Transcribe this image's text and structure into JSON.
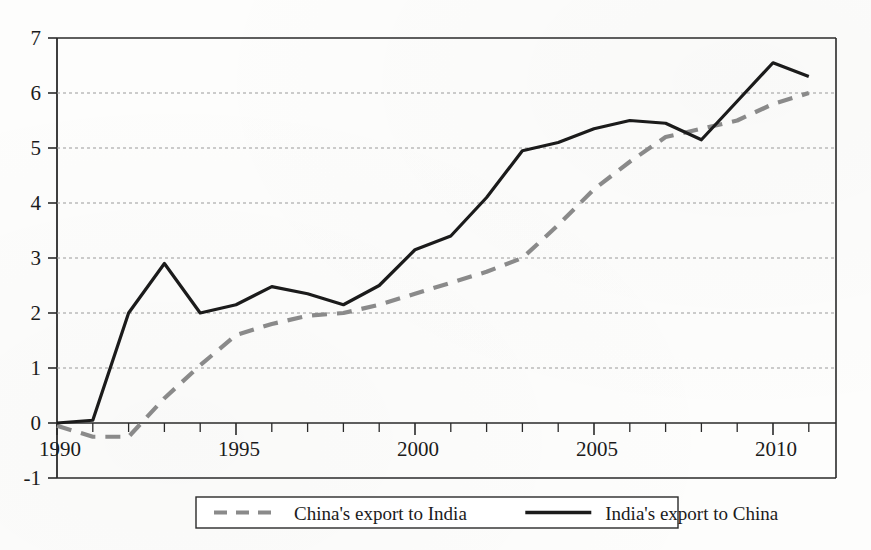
{
  "chart_data": {
    "type": "line",
    "title": "",
    "subtitle": "",
    "xlabel": "",
    "ylabel": "",
    "xlim": [
      1990,
      2011
    ],
    "ylim": [
      -1,
      7
    ],
    "grid": true,
    "grid_axis": "y",
    "legend_position": "bottom",
    "y_ticks": [
      "7",
      "6",
      "5",
      "4",
      "3",
      "2",
      "1",
      "0",
      "-1"
    ],
    "y_tick_values": [
      7,
      6,
      5,
      4,
      3,
      2,
      1,
      0,
      -1
    ],
    "x_ticks": [
      "1990",
      "1995",
      "2000",
      "2005",
      "2010"
    ],
    "x_tick_values": [
      1990,
      1995,
      2000,
      2005,
      2010
    ],
    "x_minor_tick_values": [
      1991,
      1992,
      1993,
      1994,
      1996,
      1997,
      1998,
      1999,
      2001,
      2002,
      2003,
      2004,
      2006,
      2007,
      2008,
      2009,
      2011
    ],
    "x": [
      1990,
      1991,
      1992,
      1993,
      1994,
      1995,
      1996,
      1997,
      1998,
      1999,
      2000,
      2001,
      2002,
      2003,
      2004,
      2005,
      2006,
      2007,
      2008,
      2009,
      2010,
      2011
    ],
    "series": [
      {
        "name": "China's export to India",
        "style": "dashed",
        "color": "#8a8a8a",
        "values": [
          -0.05,
          -0.25,
          -0.25,
          0.45,
          1.05,
          1.6,
          1.8,
          1.95,
          2.0,
          2.15,
          2.35,
          2.55,
          2.75,
          3.0,
          3.6,
          4.25,
          4.75,
          5.2,
          5.35,
          5.5,
          5.8,
          6.0
        ]
      },
      {
        "name": "India's export to China",
        "style": "solid",
        "color": "#1b1b1b",
        "values": [
          0.0,
          0.05,
          2.0,
          2.9,
          2.0,
          2.15,
          2.48,
          2.35,
          2.15,
          2.5,
          3.15,
          3.4,
          4.1,
          4.95,
          5.1,
          5.35,
          5.5,
          5.45,
          5.15,
          5.85,
          6.55,
          6.3
        ]
      }
    ],
    "legend": [
      {
        "label": "China's export to India",
        "style": "dashed",
        "color": "#8a8a8a"
      },
      {
        "label": "India's export to China",
        "style": "solid",
        "color": "#1b1b1b"
      }
    ]
  }
}
